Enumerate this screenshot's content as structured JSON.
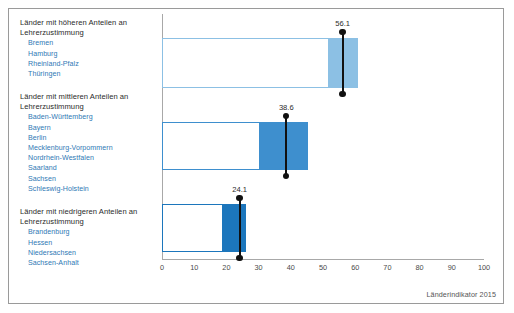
{
  "figure": {
    "source_note": "Länderindikator 2015"
  },
  "axis": {
    "ticks": [
      "0",
      "10",
      "20",
      "30",
      "40",
      "50",
      "60",
      "70",
      "80",
      "90",
      "100"
    ]
  },
  "groups": [
    {
      "heading": "Länder mit höheren Anteilen an\nLehrerzustimmung",
      "states": [
        "Bremen",
        "Hamburg",
        "Rheinland-Pfalz",
        "Thüringen"
      ],
      "value_label": "56.1",
      "color": "#8cc0e4"
    },
    {
      "heading": "Länder mit mittleren Anteilen an\nLehrerzustimmung",
      "states": [
        "Baden-Württemberg",
        "Bayern",
        "Berlin",
        "Mecklenburg-Vorpommern",
        "Nordrhein-Westfalen",
        "Saarland",
        "Sachsen",
        "Schleswig-Holstein"
      ],
      "value_label": "38.6",
      "color": "#3e8fce"
    },
    {
      "heading": "Länder mit niedrigeren Anteilen an\nLehrerzustimmung",
      "states": [
        "Brandenburg",
        "Hessen",
        "Niedersachsen",
        "Sachsen-Anhalt"
      ],
      "value_label": "24.1",
      "color": "#1c76bc"
    }
  ],
  "chart_data": {
    "type": "bar",
    "orientation": "horizontal",
    "title": "",
    "xlabel": "",
    "ylabel": "",
    "xlim": [
      0,
      100
    ],
    "xticks": [
      0,
      10,
      20,
      30,
      40,
      50,
      60,
      70,
      80,
      90,
      100
    ],
    "grid": false,
    "legend": "none",
    "annotation": "Länderindikator 2015",
    "categories": [
      "Länder mit höheren Anteilen an Lehrerzustimmung",
      "Länder mit mittleren Anteilen an Lehrerzustimmung",
      "Länder mit niedrigeren Anteilen an Lehrerzustimmung"
    ],
    "series": [
      {
        "name": "Spannweite (unterer Bereich, weiß)",
        "values": [
          52.0,
          30.5,
          18.8
        ],
        "note": "rechter Rand des weißen Kastens; Kasten beginnt bei 0"
      },
      {
        "name": "Spannweite (oberer Bereich, farbig)",
        "values": [
          61.0,
          45.4,
          26.0
        ],
        "note": "rechter Rand des farbigen Balkensegments"
      },
      {
        "name": "Mittelwert (Markierung)",
        "values": [
          56.1,
          38.6,
          24.1
        ]
      }
    ],
    "bar_colors": [
      "#8cc0e4",
      "#3e8fce",
      "#1c76bc"
    ],
    "value_labels": [
      "56.1",
      "38.6",
      "24.1"
    ],
    "group_members": [
      [
        "Bremen",
        "Hamburg",
        "Rheinland-Pfalz",
        "Thüringen"
      ],
      [
        "Baden-Württemberg",
        "Bayern",
        "Berlin",
        "Mecklenburg-Vorpommern",
        "Nordrhein-Westfalen",
        "Saarland",
        "Sachsen",
        "Schleswig-Holstein"
      ],
      [
        "Brandenburg",
        "Hessen",
        "Niedersachsen",
        "Sachsen-Anhalt"
      ]
    ]
  }
}
